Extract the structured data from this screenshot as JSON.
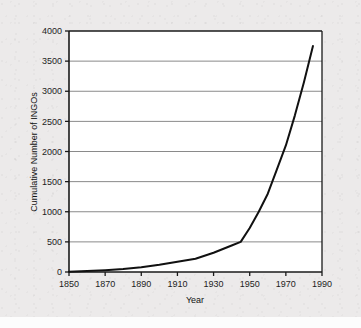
{
  "figure": {
    "kind": "scanned-line-chart",
    "background_color": "#eceaea",
    "plot_background_color": "#ffffff"
  },
  "chart_data": {
    "type": "line",
    "title": "",
    "xlabel": "Year",
    "ylabel": "Cumulative Number of  INGOs",
    "xlim": [
      1850,
      1990
    ],
    "ylim": [
      0,
      4000
    ],
    "xticks": [
      1850,
      1870,
      1890,
      1910,
      1930,
      1950,
      1970,
      1990
    ],
    "yticks": [
      0,
      500,
      1000,
      1500,
      2000,
      2500,
      3000,
      3500,
      4000
    ],
    "xtick_labels": [
      "1850",
      "1870",
      "1890",
      "1910",
      "1930",
      "1950",
      "1970",
      "1990"
    ],
    "ytick_labels": [
      "0",
      "500",
      "1000",
      "1500",
      "2000",
      "2500",
      "3000",
      "3500",
      "4000"
    ],
    "grid": "horizontal",
    "grid_color": "#8a8a8a",
    "axis_color": "#1a1a1a",
    "line_color": "#111111",
    "line_width": 2,
    "legend": "none",
    "series": [
      {
        "name": "Cumulative Number of INGOs",
        "x": [
          1850,
          1860,
          1870,
          1880,
          1890,
          1900,
          1910,
          1920,
          1930,
          1940,
          1945,
          1950,
          1955,
          1960,
          1965,
          1970,
          1975,
          1980,
          1985
        ],
        "values": [
          5,
          15,
          30,
          50,
          80,
          120,
          170,
          220,
          320,
          440,
          500,
          730,
          1000,
          1300,
          1700,
          2100,
          2600,
          3150,
          3750
        ]
      }
    ]
  }
}
